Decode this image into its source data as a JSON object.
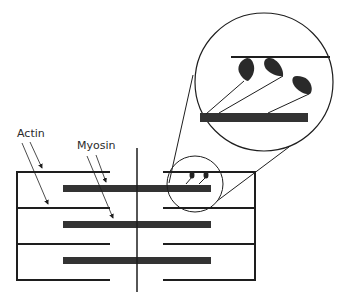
{
  "diagram": {
    "labels": {
      "actin": "Actin",
      "myosin": "Myosin"
    },
    "colors": {
      "line": "#1e1e1e",
      "myosin_bar": "#333333",
      "background": "#ffffff"
    },
    "rows": 3,
    "magnified_view": {
      "myosin_heads_count": 3,
      "small_view_heads_count": 2
    }
  }
}
